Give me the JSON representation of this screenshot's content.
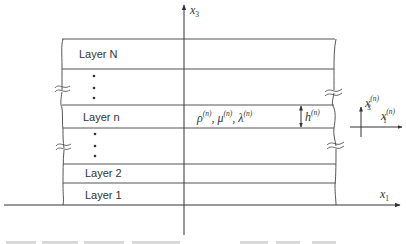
{
  "diagram": {
    "type": "layered-half-space-schematic",
    "axes": {
      "global_vertical": {
        "symbol": "x",
        "subscript": "3"
      },
      "global_horizontal": {
        "symbol": "x",
        "subscript": "1"
      },
      "local_vertical": {
        "symbol": "x",
        "subscript": "3",
        "superscript": "(n)"
      },
      "local_horizontal": {
        "symbol": "x",
        "subscript": "1",
        "superscript": "(n)"
      }
    },
    "layers": [
      {
        "label": "Layer N"
      },
      {
        "label": "Layer n"
      },
      {
        "label": "Layer 2"
      },
      {
        "label": "Layer 1"
      }
    ],
    "ellipsis": "⋮",
    "layer_n_properties": {
      "rho": {
        "symbol": "ρ",
        "superscript": "(n)"
      },
      "mu": {
        "symbol": "μ",
        "superscript": "(n)"
      },
      "lambda": {
        "symbol": "λ",
        "superscript": "(n)"
      },
      "separator": ", "
    },
    "thickness": {
      "symbol": "h",
      "superscript": "(n)"
    },
    "colors": {
      "lines": "#555555",
      "text": "#333333",
      "background": "#ffffff"
    }
  }
}
